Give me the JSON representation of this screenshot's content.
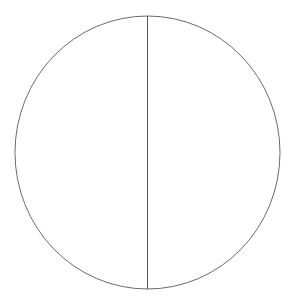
{
  "diagram": {
    "type": "circle-with-diameter",
    "canvas": {
      "width": 293,
      "height": 306,
      "background": "#ffffff"
    },
    "circle": {
      "cx": 147.5,
      "cy": 152.5,
      "rx": 132.5,
      "ry": 136.5,
      "stroke": "#6b6b6b",
      "stroke_width": 1,
      "fill": "none"
    },
    "diameter": {
      "x1": 147.5,
      "y1": 16,
      "x2": 147.5,
      "y2": 289,
      "stroke": "#555555",
      "stroke_width": 1,
      "orientation": "vertical"
    }
  }
}
